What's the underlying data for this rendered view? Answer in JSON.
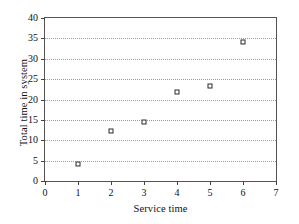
{
  "chart_data": {
    "type": "scatter",
    "title": "",
    "xlabel": "Service time",
    "ylabel": "Total time in system",
    "xlim": [
      0,
      7
    ],
    "ylim": [
      0,
      40
    ],
    "xticks": [
      "0",
      "1",
      "2",
      "3",
      "4",
      "5",
      "6",
      "7"
    ],
    "yticks": [
      "0",
      "5",
      "10",
      "15",
      "20",
      "25",
      "30",
      "35",
      "40"
    ],
    "grid": "horizontal-dotted",
    "legend": "none",
    "marker": "open-square",
    "marker_color": "#2a2a2a",
    "x": [
      1,
      2,
      3,
      4,
      5,
      6
    ],
    "y": [
      4.2,
      12.3,
      14.5,
      21.8,
      23.3,
      34.1
    ],
    "points": [
      {
        "x": 1,
        "y": 4.2
      },
      {
        "x": 2,
        "y": 12.3
      },
      {
        "x": 3,
        "y": 14.5
      },
      {
        "x": 4,
        "y": 21.8
      },
      {
        "x": 5,
        "y": 23.3
      },
      {
        "x": 6,
        "y": 34.1
      }
    ]
  }
}
